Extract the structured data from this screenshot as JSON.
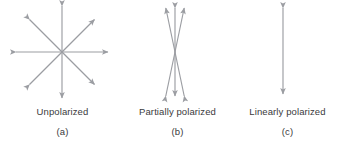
{
  "figure": {
    "background_color": "#ffffff",
    "stroke_color": "#9b9da2",
    "text_color": "#3a3a3c",
    "width": 345,
    "height": 153
  },
  "panels": [
    {
      "id": "a",
      "caption": "Unpolarized",
      "sub_caption": "(a)",
      "diagram_name": "unpolarized-arrow-star",
      "description": "eight radial double-headed arrows crossing at a common center",
      "arrow_count": 4,
      "arrow_angles_deg": [
        0,
        45,
        90,
        135
      ],
      "center": {
        "x": 62,
        "y": 52
      },
      "arrow_half_length": 46
    },
    {
      "id": "b",
      "caption": "Partially polarized",
      "sub_caption": "(b)",
      "diagram_name": "partially-polarized-arrows",
      "description": "three double-headed arrows clustered near vertical, crossing at a center",
      "arrow_count": 3,
      "arrow_angles_deg": [
        78,
        90,
        102
      ],
      "center": {
        "x": 50,
        "y": 50
      },
      "arrow_half_length": 44
    },
    {
      "id": "c",
      "caption": "Linearly polarized",
      "sub_caption": "(c)",
      "diagram_name": "linearly-polarized-arrow",
      "description": "single vertical double-headed arrow",
      "arrow_count": 1,
      "arrow_angles_deg": [
        90
      ],
      "center": {
        "x": 53,
        "y": 50
      },
      "arrow_half_length": 42
    }
  ]
}
